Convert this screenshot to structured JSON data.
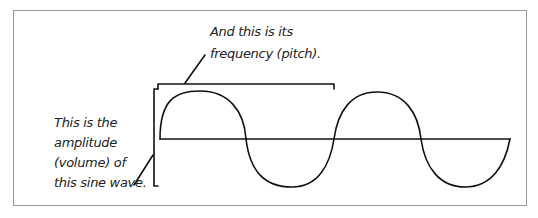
{
  "diagram": {
    "annotations": {
      "frequency": [
        "And this is its",
        "frequency (pitch)."
      ],
      "amplitude": [
        "This is the",
        "amplitude",
        "(volume) of",
        "this sine wave."
      ]
    },
    "colors": {
      "line": "#111111",
      "frame": "#9a9a9a",
      "background": "#ffffff"
    },
    "wave": {
      "type": "sine",
      "cycles": 2
    }
  }
}
